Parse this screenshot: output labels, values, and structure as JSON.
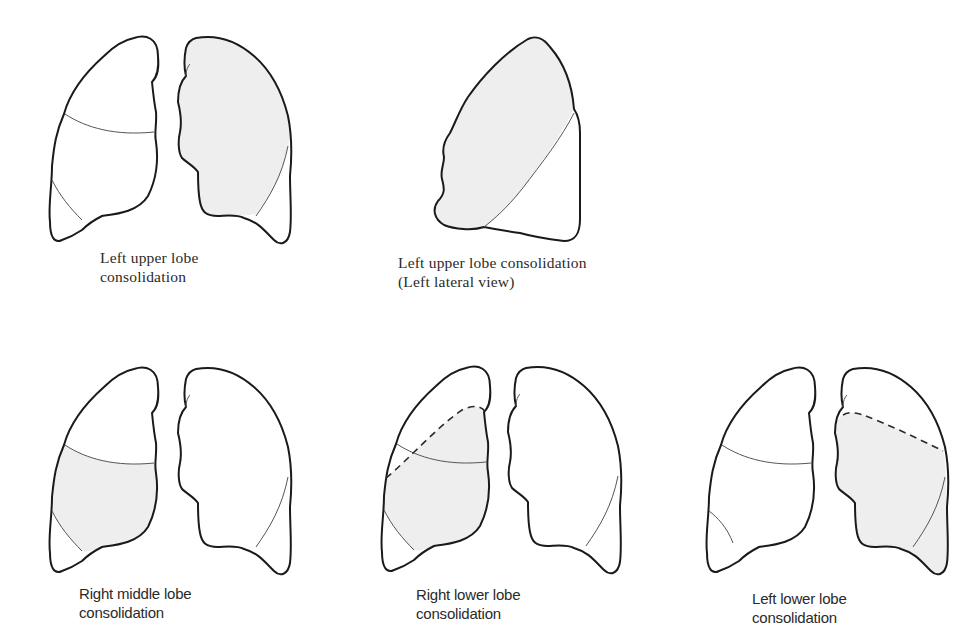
{
  "figure": {
    "shade_color": "#eeeeee",
    "line_color": "#1a1a1a",
    "panels": [
      {
        "id": "left-upper-lobe-frontal",
        "caption": {
          "line1": "Left upper lobe",
          "line2": "consolidation"
        },
        "view": "frontal",
        "consolidated_lobe": "left upper lobe"
      },
      {
        "id": "left-upper-lobe-lateral",
        "caption": {
          "line1": "Left upper lobe consolidation",
          "line2": "(Left lateral view)"
        },
        "view": "left lateral",
        "consolidated_lobe": "left upper lobe"
      },
      {
        "id": "right-middle-lobe",
        "caption": {
          "line1": "Right middle lobe",
          "line2": "consolidation"
        },
        "view": "frontal",
        "consolidated_lobe": "right middle lobe"
      },
      {
        "id": "right-lower-lobe",
        "caption": {
          "line1": "Right lower lobe",
          "line2": "consolidation"
        },
        "view": "frontal",
        "consolidated_lobe": "right lower lobe"
      },
      {
        "id": "left-lower-lobe",
        "caption": {
          "line1": "Left lower lobe",
          "line2": "consolidation"
        },
        "view": "frontal",
        "consolidated_lobe": "left lower lobe"
      }
    ]
  }
}
